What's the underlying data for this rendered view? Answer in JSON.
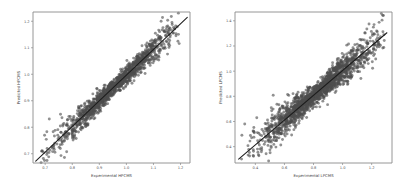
{
  "figure": {
    "background": "#ffffff",
    "point_color": "#4d4d4d",
    "line_color": "#1c1c1c",
    "axis_color": "#8a8a8a",
    "width": 404,
    "height": 191
  },
  "chart_data": [
    {
      "type": "scatter",
      "panel": "left",
      "title": "",
      "xlabel": "Experimental HPCMS",
      "ylabel": "Predicted HPCMS",
      "xlim": [
        0.655,
        1.235
      ],
      "ylim": [
        0.665,
        1.235
      ],
      "xticks": [
        0.7,
        0.8,
        0.9,
        1.0,
        1.1,
        1.2
      ],
      "xticklabels": [
        "0.7",
        "0.8",
        "0.9",
        "1.0",
        "1.1",
        "1.2"
      ],
      "yticks": [
        0.7,
        0.8,
        0.9,
        1.0,
        1.1,
        1.2
      ],
      "yticklabels": [
        "0.7",
        "0.8",
        "0.9",
        "1.0",
        "1.1",
        "1.2"
      ],
      "grid": false,
      "legend": null,
      "marker_size": 1.45,
      "marker_alpha": 0.62,
      "n_points": 1400,
      "scatter_noise_sd": 0.0175,
      "fit_line": {
        "x": [
          0.665,
          1.225
        ],
        "y": [
          0.672,
          1.215
        ],
        "slope": 0.9696,
        "intercept": 0.0271
      },
      "x_distribution": {
        "center": 0.955,
        "spread": 0.108,
        "min": 0.672,
        "max": 1.205
      }
    },
    {
      "type": "scatter",
      "panel": "right",
      "title": "",
      "xlabel": "Experimental LPCMS",
      "ylabel": "Predicted LPCMS",
      "xlim": [
        0.26,
        1.34
      ],
      "ylim": [
        0.27,
        1.47
      ],
      "xticks": [
        0.4,
        0.6,
        0.8,
        1.0,
        1.2
      ],
      "xticklabels": [
        "0.4",
        "0.6",
        "0.8",
        "1.0",
        "1.2"
      ],
      "yticks": [
        0.4,
        0.6,
        0.8,
        1.0,
        1.2,
        1.4
      ],
      "yticklabels": [
        "0.4",
        "0.6",
        "0.8",
        "1.0",
        "1.2",
        "1.4"
      ],
      "grid": false,
      "legend": null,
      "marker_size": 1.45,
      "marker_alpha": 0.62,
      "n_points": 1700,
      "scatter_noise_sd": 0.048,
      "fit_line": {
        "x": [
          0.285,
          1.305
        ],
        "y": [
          0.3,
          1.305
        ],
        "slope": 0.9853,
        "intercept": 0.0191
      },
      "x_distribution": {
        "center": 0.815,
        "spread": 0.205,
        "min": 0.3,
        "max": 1.29
      }
    }
  ]
}
